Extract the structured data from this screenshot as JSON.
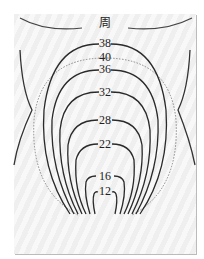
{
  "figure": {
    "top_label": "周",
    "contours": [
      {
        "label": "38",
        "x": 105,
        "y": 37
      },
      {
        "label": "40",
        "x": 105,
        "y": 52
      },
      {
        "label": "36",
        "x": 105,
        "y": 63
      },
      {
        "label": "32",
        "x": 105,
        "y": 86
      },
      {
        "label": "28",
        "x": 105,
        "y": 115
      },
      {
        "label": "22",
        "x": 105,
        "y": 138
      },
      {
        "label": "16",
        "x": 105,
        "y": 171
      },
      {
        "label": "12",
        "x": 105,
        "y": 186
      }
    ],
    "colors": {
      "line": "#2a2a2a",
      "dotted": "#888888",
      "background_stripe_a": "#efefef",
      "background_stripe_b": "#f8f8f8"
    }
  }
}
